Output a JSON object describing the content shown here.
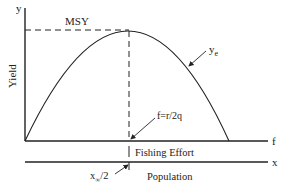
{
  "diagram": {
    "axes": {
      "y_axis_symbol": "y",
      "y_axis_label": "Yield",
      "effort_axis_symbol": "f",
      "effort_axis_label": "Fishing Effort",
      "population_axis_symbol": "x",
      "population_axis_label": "Population"
    },
    "annotations": {
      "msy": "MSY",
      "curve_label_base": "y",
      "curve_label_sub": "e",
      "optimal_effort": "f=r/2q",
      "half_carrying_base": "x",
      "half_carrying_sub": "∞",
      "half_carrying_tail": "/2"
    },
    "colors": {
      "line": "#222222",
      "background": "#ffffff"
    }
  }
}
